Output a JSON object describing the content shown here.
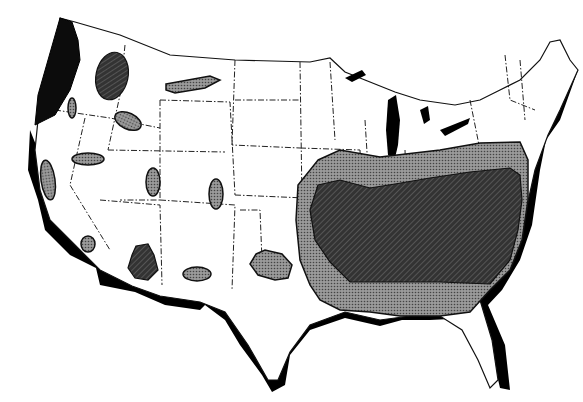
{
  "map": {
    "subject": "Contiguous United States",
    "style": "black-and-white shaded zone map",
    "legend": [],
    "zones": [
      {
        "id": "pacific-northwest-coast",
        "shade": "black"
      },
      {
        "id": "northern-idaho",
        "shade": "dark"
      },
      {
        "id": "central-montana",
        "shade": "light"
      },
      {
        "id": "eastern-oregon",
        "shade": "light"
      },
      {
        "id": "southwest-idaho",
        "shade": "light"
      },
      {
        "id": "northern-nevada",
        "shade": "light"
      },
      {
        "id": "sierra-nevada",
        "shade": "light"
      },
      {
        "id": "southern-california",
        "shade": "light"
      },
      {
        "id": "utah",
        "shade": "light"
      },
      {
        "id": "colorado",
        "shade": "light"
      },
      {
        "id": "central-arizona",
        "shade": "dark"
      },
      {
        "id": "new-mexico",
        "shade": "light"
      },
      {
        "id": "southwest-oklahoma",
        "shade": "light"
      },
      {
        "id": "southeast-outer",
        "shade": "light"
      },
      {
        "id": "southeast-core",
        "shade": "dark"
      }
    ],
    "colors": {
      "background": "#ffffff",
      "land": "#ffffff",
      "outline": "#111111",
      "light_shade": "#8a8a8a",
      "dark_shade": "#2a2a2a",
      "black": "#0c0c0c"
    }
  }
}
